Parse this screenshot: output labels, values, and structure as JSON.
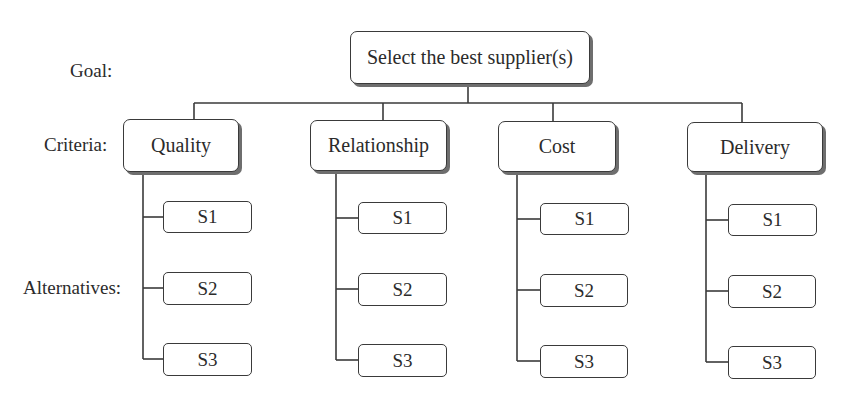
{
  "levels": {
    "goal_label": "Goal:",
    "criteria_label": "Criteria:",
    "alternatives_label": "Alternatives:"
  },
  "goal": {
    "label": "Select the best supplier(s)"
  },
  "criteria": [
    {
      "label": "Quality",
      "alternatives": [
        "S1",
        "S2",
        "S3"
      ]
    },
    {
      "label": "Relationship",
      "alternatives": [
        "S1",
        "S2",
        "S3"
      ]
    },
    {
      "label": "Cost",
      "alternatives": [
        "S1",
        "S2",
        "S3"
      ]
    },
    {
      "label": "Delivery",
      "alternatives": [
        "S1",
        "S2",
        "S3"
      ]
    }
  ],
  "colors": {
    "line": "#3a3a3a",
    "shadow": "#6e6e6e",
    "text": "#2b2b2b",
    "background": "#ffffff"
  }
}
